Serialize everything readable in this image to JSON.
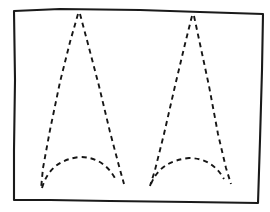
{
  "image": {
    "title": "Dashed double-peak motif inside hand-drawn frame",
    "medium": "line drawing",
    "background_color": "#ffffff",
    "ink_color": "#161616",
    "width": 270,
    "height": 212
  },
  "frame": {
    "name": "hand-drawn rectangular border",
    "stroke_color": "#1a1a1a",
    "stroke_width": 2.1,
    "style": "solid",
    "corners": {
      "top_left": [
        14,
        10
      ],
      "top_right": [
        263,
        14
      ],
      "bottom_right": [
        258,
        203
      ],
      "bottom_left": [
        14,
        200
      ]
    },
    "path": "M 14 11 L 60 9 L 140 10 L 200 12 L 263 14 L 262 70 L 260 140 L 258 203 L 190 202 L 110 201 L 50 200 L 14 200 L 14 150 L 15 80 Z"
  },
  "motifs": [
    {
      "name": "left peak motif",
      "stroke_color": "#161616",
      "stroke_width": 1.9,
      "style": "dashed",
      "dash_pattern": "5 4",
      "apex": [
        79,
        14
      ],
      "left_base": [
        41,
        189
      ],
      "right_base": [
        124,
        184
      ],
      "arch": {
        "left_end": [
          42,
          188
        ],
        "peak": [
          80,
          157
        ],
        "right_end": [
          116,
          180
        ]
      },
      "left_leg_path": "M 78 14 L 70 42 L 60 82 L 50 130 L 43 168 L 41 189",
      "right_leg_path": "M 80 14 L 88 44 L 99 86 L 110 132 L 119 166 L 124 184",
      "arch_path": "M 42 188 Q 50 160 80 157 Q 104 157 116 180"
    },
    {
      "name": "right peak motif",
      "stroke_color": "#161616",
      "stroke_width": 1.9,
      "style": "dashed",
      "dash_pattern": "5 4",
      "apex": [
        193,
        16
      ],
      "left_base": [
        150,
        186
      ],
      "right_base": [
        231,
        184
      ],
      "arch": {
        "left_end": [
          151,
          184
        ],
        "peak": [
          189,
          158
        ],
        "right_end": [
          224,
          179
        ]
      },
      "left_leg_path": "M 192 16 L 185 44 L 175 86 L 164 134 L 155 170 L 150 186",
      "right_leg_path": "M 194 16 L 200 44 L 209 86 L 218 134 L 226 168 L 231 184",
      "arch_path": "M 151 184 Q 160 161 189 158 Q 212 158 224 179"
    }
  ],
  "caption": ""
}
